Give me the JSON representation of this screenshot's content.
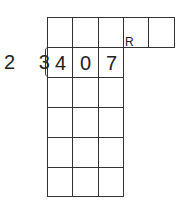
{
  "division": {
    "divisor": "2 3",
    "dividend_digits": [
      "4",
      "0",
      "7"
    ],
    "remainder_label": "R"
  },
  "grid": {
    "columns": 3,
    "rows": 6,
    "remainder_boxes": 2
  }
}
